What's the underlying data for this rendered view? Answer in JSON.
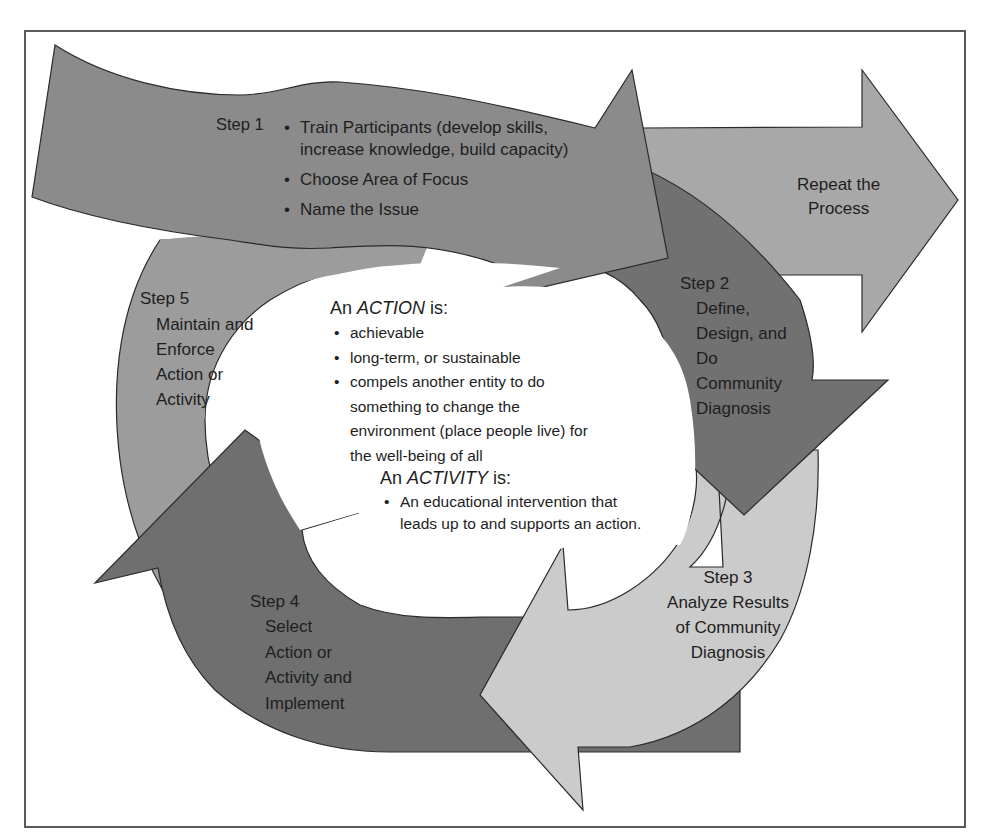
{
  "diagram": {
    "colors": {
      "step1": "#8b8b8b",
      "step2": "#717171",
      "repeat": "#a8a8a8",
      "step3": "#cbcbcb",
      "step4": "#6f6f6f",
      "step5": "#9c9c9c",
      "outline": "#2a2a2a",
      "frame": "#5a5a5a"
    },
    "step1": {
      "label": "Step 1",
      "bullets": [
        "Train Participants (develop skills,",
        "increase knowledge, build capacity)",
        "Choose Area of Focus",
        "Name the Issue"
      ]
    },
    "repeat": {
      "line1": "Repeat the",
      "line2": "Process"
    },
    "step2": {
      "label": "Step  2",
      "lines": [
        "Define,",
        "Design, and",
        "Do",
        "Community",
        "Diagnosis"
      ]
    },
    "step3": {
      "label": "Step 3",
      "lines": [
        "Analyze Results",
        "of Community",
        "Diagnosis"
      ]
    },
    "step4": {
      "label": "Step 4",
      "lines": [
        "Select",
        "Action or",
        "Activity and",
        "Implement"
      ]
    },
    "step5": {
      "label": "Step 5",
      "lines": [
        "Maintain and",
        "Enforce",
        "Action or",
        "Activity"
      ]
    },
    "center": {
      "action_prefix": "An ",
      "action_word": "ACTION",
      "action_suffix": " is:",
      "action_bullets": [
        "achievable",
        "long-term, or sustainable",
        "compels another entity to do"
      ],
      "action_continuation": [
        "something to change the",
        "environment (place people live) for",
        "the well-being of all"
      ],
      "activity_prefix": "An ",
      "activity_word": "ACTIVITY",
      "activity_suffix": " is:",
      "activity_bullets": [
        "An educational intervention that"
      ],
      "activity_continuation": [
        "leads up to and supports an action."
      ]
    }
  }
}
